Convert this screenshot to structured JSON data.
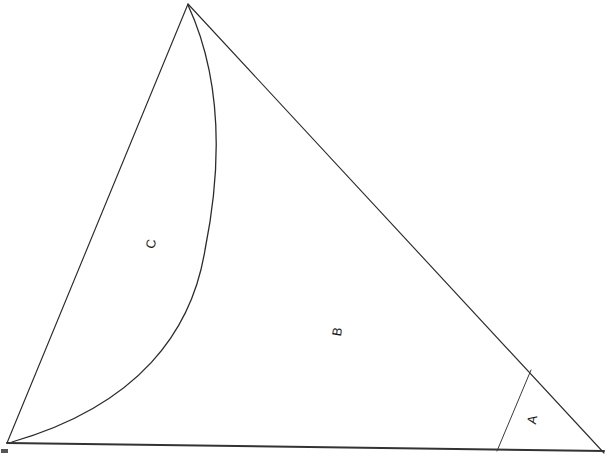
{
  "figure": {
    "background_color": "#ffffff",
    "ink_color": "#2b2b2b",
    "width": 612,
    "height": 456,
    "labels": [
      {
        "id": "A",
        "text": "A",
        "x": 533,
        "y": 420,
        "rotation": -80
      },
      {
        "id": "B",
        "text": "B",
        "x": 338,
        "y": 332,
        "rotation": -80
      },
      {
        "id": "C",
        "text": "C",
        "x": 152,
        "y": 244,
        "rotation": -80
      }
    ],
    "vertices": {
      "apex": {
        "x": 188,
        "y": 4
      },
      "bottom_left": {
        "x": 7,
        "y": 443
      },
      "bottom_right": {
        "x": 604,
        "y": 452
      }
    },
    "strokes": {
      "left_edge": "M 188 4 L 7 443",
      "hypotenuse": "M 188 4 L 604 453",
      "baseline": "M 7 443 L 604 451",
      "divider": "M 531 370 L 497 451",
      "arc": "M 188 5 C 218 70 225 150 205 250 C 192 330 140 405 12 442"
    },
    "corner_mark": {
      "x": 1,
      "y": 449,
      "width": 7,
      "height": 4
    }
  }
}
